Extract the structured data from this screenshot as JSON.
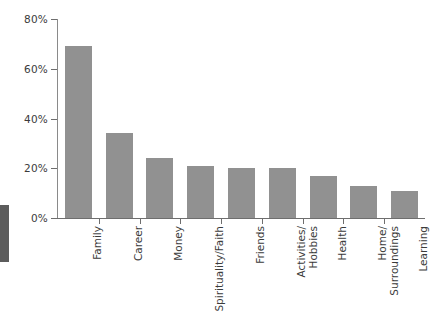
{
  "chart_data": {
    "type": "bar",
    "title": "",
    "xlabel": "",
    "ylabel": "",
    "ylim": [
      0,
      80
    ],
    "grid": false,
    "legend": "none",
    "orientation": "vertical",
    "bar_color": "#919191",
    "ytick_labels": [
      "0%",
      "20%",
      "40%",
      "60%",
      "80%"
    ],
    "ytick_values": [
      0,
      20,
      40,
      60,
      80
    ],
    "categories": [
      "Family",
      "Career",
      "Money",
      "Spirituality/Faith",
      "Friends",
      "Activities/Hobbies",
      "Health",
      "Home/Surroundings",
      "Learning"
    ],
    "category_lines": [
      [
        "Family"
      ],
      [
        "Career"
      ],
      [
        "Money"
      ],
      [
        "Spirituality/Faith"
      ],
      [
        "Friends"
      ],
      [
        "Activities/",
        "Hobbies"
      ],
      [
        "Health"
      ],
      [
        "Home/",
        "Surroundings"
      ],
      [
        "Learning"
      ]
    ],
    "values": [
      69,
      34,
      24,
      21,
      20,
      20,
      17,
      13,
      11
    ]
  },
  "artifact": {
    "scan_edge_color": "#5c5c5c"
  }
}
